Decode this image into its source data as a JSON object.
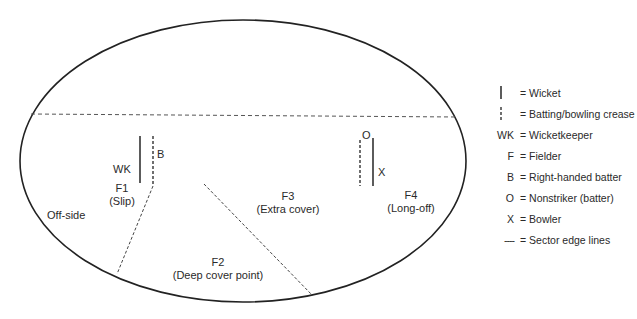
{
  "diagram": {
    "side_label": "Off-side",
    "markers": {
      "wk": "WK",
      "batter": "B",
      "nonstriker": "O",
      "bowler": "X"
    },
    "fielders": [
      {
        "id": "F1",
        "position": "(Slip)"
      },
      {
        "id": "F2",
        "position": "(Deep cover point)"
      },
      {
        "id": "F3",
        "position": "(Extra cover)"
      },
      {
        "id": "F4",
        "position": "(Long-off)"
      }
    ]
  },
  "legend": {
    "items": [
      {
        "symbol": "wicket-line",
        "symbol_text": "",
        "label": "= Wicket"
      },
      {
        "symbol": "crease-dashed-line",
        "symbol_text": "",
        "label": "= Batting/bowling crease"
      },
      {
        "symbol": "text",
        "symbol_text": "WK",
        "label": "= Wicketkeeper"
      },
      {
        "symbol": "text",
        "symbol_text": "F",
        "label": "= Fielder"
      },
      {
        "symbol": "text",
        "symbol_text": "B",
        "label": "= Right-handed batter"
      },
      {
        "symbol": "text",
        "symbol_text": "O",
        "label": "= Nonstriker (batter)"
      },
      {
        "symbol": "text",
        "symbol_text": "X",
        "label": "= Bowler"
      },
      {
        "symbol": "dashed-line",
        "symbol_text": "----",
        "label": "= Sector edge lines"
      }
    ]
  }
}
